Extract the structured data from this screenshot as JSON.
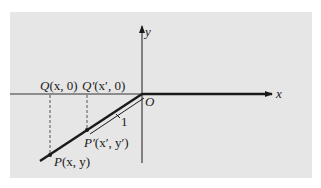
{
  "diagram": {
    "axes": {
      "x_label": "x",
      "y_label": "y",
      "origin_label": "O"
    },
    "points": {
      "Q": {
        "name": "Q",
        "coords": "(x, 0)"
      },
      "Q_prime": {
        "name": "Q′",
        "coords": "(x′, 0)"
      },
      "P": {
        "name": "P",
        "coords": "(x, y)"
      },
      "P_prime": {
        "name": "P′",
        "coords": "(x′, y′)"
      }
    },
    "segment_label": "1",
    "colors": {
      "panel": "#e6e6e6",
      "ink": "#1a1a1a",
      "dashed": "#555555"
    }
  }
}
